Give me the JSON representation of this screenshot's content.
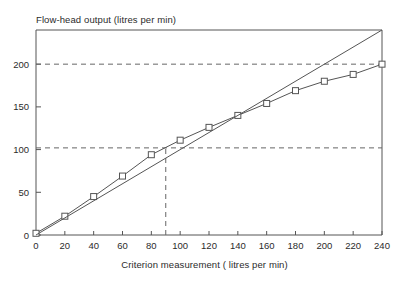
{
  "chart_data": {
    "type": "line",
    "title": "Flow-head output (litres per min)",
    "xlabel": "Criterion measurement ( litres per min)",
    "ylabel": "",
    "xlim": [
      0,
      240
    ],
    "ylim": [
      0,
      240
    ],
    "grid": false,
    "legend": "none",
    "xticks": [
      0,
      20,
      40,
      60,
      80,
      100,
      120,
      140,
      160,
      180,
      200,
      220,
      240
    ],
    "yticks": [
      0,
      50,
      100,
      150,
      200
    ],
    "xtick_labels": [
      "0",
      "20",
      "40",
      "60",
      "80",
      "100",
      "120",
      "140",
      "160",
      "180",
      "200",
      "220",
      "240"
    ],
    "ytick_labels": [
      "0",
      "50",
      "100",
      "150",
      "200"
    ],
    "series": [
      {
        "name": "flow-head-output",
        "marker": "open-square",
        "color": "#555555",
        "x": [
          0,
          20,
          40,
          60,
          80,
          100,
          120,
          140,
          160,
          180,
          200,
          220,
          240
        ],
        "values": [
          2,
          22,
          45,
          69,
          94,
          111,
          126,
          140,
          154,
          169,
          180,
          188,
          200
        ]
      },
      {
        "name": "line-of-identity",
        "marker": "none",
        "color": "#555555",
        "x": [
          0,
          240
        ],
        "values": [
          0,
          240
        ]
      }
    ],
    "annotations": [
      {
        "name": "reference-horizontal-dashed",
        "type": "hline",
        "y": 102,
        "x_from": 0,
        "x_to": 240
      },
      {
        "name": "reference-vertical-dashed",
        "type": "vline",
        "x": 90,
        "y_from": 0,
        "y_to": 102
      },
      {
        "name": "reference-horizontal-dashed-upper",
        "type": "hline",
        "y": 200,
        "x_from": 0,
        "x_to": 240
      }
    ]
  }
}
